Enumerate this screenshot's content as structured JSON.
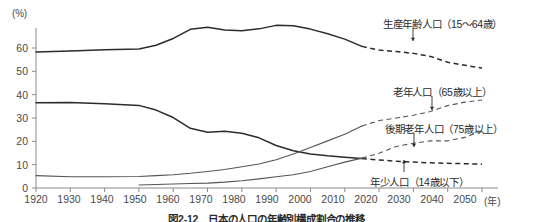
{
  "chart_data": {
    "type": "line",
    "title": "図2-12　日本の人口の年齢別構成割合の推移",
    "xlabel": "(年)",
    "ylabel": "(%)",
    "yunit": "(%)",
    "xlim": [
      1920,
      2050
    ],
    "ylim": [
      0,
      70
    ],
    "yticks": [
      0,
      10,
      20,
      30,
      40,
      50,
      60
    ],
    "ytick_labels": [
      "0",
      "10",
      "20",
      "30",
      "40",
      "50",
      "60"
    ],
    "xticks": [
      1920,
      1930,
      1940,
      1950,
      1960,
      1970,
      1980,
      1990,
      2000,
      2010,
      2020,
      2030,
      2040,
      2050
    ],
    "xtick_labels": [
      "1920",
      "1930",
      "1940",
      "1950",
      "1960",
      "1970",
      "1980",
      "1990",
      "2000",
      "2010",
      "2020",
      "2030",
      "2040",
      "2050"
    ],
    "grid": false,
    "legend_position": "inline-annotations",
    "actual_projection_split_year": 2015,
    "series": [
      {
        "name": "生産年齢人口（15〜64歳）",
        "label": "生産年齢人口（15〜64歳）",
        "color": "#2b2b2b",
        "x": [
          1920,
          1930,
          1940,
          1950,
          1955,
          1960,
          1965,
          1970,
          1975,
          1980,
          1985,
          1990,
          1995,
          2000,
          2005,
          2010,
          2015,
          2020,
          2025,
          2030,
          2035,
          2040,
          2045,
          2050
        ],
        "values": [
          58.3,
          58.7,
          59.2,
          59.6,
          61.2,
          64.1,
          68.0,
          68.9,
          67.7,
          67.4,
          68.2,
          69.7,
          69.5,
          68.1,
          66.1,
          63.8,
          60.7,
          59.1,
          58.5,
          57.7,
          56.4,
          53.9,
          52.6,
          51.4
        ]
      },
      {
        "name": "年少人口（14歳以下）",
        "label": "年少人口（14歳以下）",
        "color": "#2b2b2b",
        "x": [
          1920,
          1930,
          1940,
          1950,
          1955,
          1960,
          1965,
          1970,
          1975,
          1980,
          1985,
          1990,
          1995,
          2000,
          2005,
          2010,
          2015,
          2020,
          2025,
          2030,
          2035,
          2040,
          2045,
          2050
        ],
        "values": [
          36.5,
          36.6,
          36.1,
          35.4,
          33.4,
          30.2,
          25.6,
          23.9,
          24.3,
          23.5,
          21.5,
          18.2,
          16.0,
          14.6,
          13.8,
          13.2,
          12.6,
          12.0,
          11.5,
          11.1,
          10.8,
          10.6,
          10.4,
          10.2
        ]
      },
      {
        "name": "老年人口（65歳以上）",
        "label": "老年人口（65歳以上）",
        "color": "#555555",
        "x": [
          1920,
          1930,
          1940,
          1950,
          1955,
          1960,
          1965,
          1970,
          1975,
          1980,
          1985,
          1990,
          1995,
          2000,
          2005,
          2010,
          2015,
          2020,
          2025,
          2030,
          2035,
          2040,
          2045,
          2050
        ],
        "values": [
          5.3,
          4.8,
          4.8,
          4.9,
          5.3,
          5.7,
          6.3,
          7.1,
          7.9,
          9.1,
          10.3,
          12.1,
          14.6,
          17.4,
          20.2,
          23.0,
          26.6,
          28.9,
          30.0,
          31.2,
          32.8,
          35.3,
          36.8,
          37.7
        ]
      },
      {
        "name": "後期老年人口（75歳以上）",
        "label": "後期老年人口（75歳以上）",
        "color": "#555555",
        "x": [
          1950,
          1955,
          1960,
          1965,
          1970,
          1975,
          1980,
          1985,
          1990,
          1995,
          2000,
          2005,
          2010,
          2015,
          2020,
          2025,
          2030,
          2035,
          2040,
          2045,
          2050
        ],
        "values": [
          1.3,
          1.5,
          1.7,
          1.9,
          2.1,
          2.5,
          3.1,
          3.9,
          4.8,
          5.7,
          7.1,
          9.1,
          11.1,
          12.8,
          14.9,
          17.8,
          19.2,
          20.2,
          20.2,
          21.7,
          24.6
        ]
      }
    ]
  },
  "annotations": [
    {
      "id": "label-working-age",
      "text": "生産年齢人口（15〜64歳）",
      "left": 383,
      "top": 16
    },
    {
      "id": "label-elderly",
      "text": "老年人口（65歳以上）",
      "left": 393,
      "top": 84
    },
    {
      "id": "label-late-elderly",
      "text": "後期老年人口（75歳以上）",
      "left": 385,
      "top": 121
    },
    {
      "id": "label-youth",
      "text": "年少人口（14歳以下）",
      "left": 370,
      "top": 174
    }
  ],
  "axes": {
    "y_unit_label": "(%)",
    "x_unit_label": "(年)",
    "ytick_labels": [
      "60",
      "50",
      "40",
      "30",
      "20",
      "10",
      "0"
    ],
    "xtick_labels": [
      "1920",
      "1930",
      "1940",
      "1950",
      "1960",
      "1970",
      "1980",
      "1990",
      "2000",
      "2010",
      "2020",
      "2030",
      "2040",
      "2050"
    ]
  },
  "caption": "図2-12　日本の人口の年齢別構成割合の推移"
}
